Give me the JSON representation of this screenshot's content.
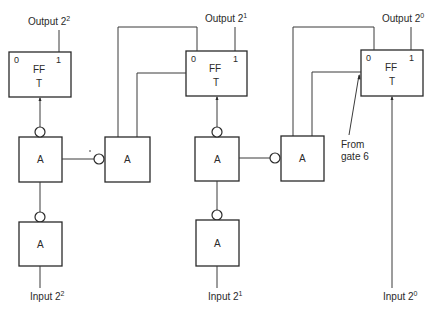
{
  "diagram": {
    "type": "logic-circuit",
    "flipflops": [
      {
        "id": "ff-2-2",
        "title": "FF",
        "subtitle": "T",
        "pin_left": "0",
        "pin_right": "1",
        "output_label": "Output 2",
        "output_exp": "2"
      },
      {
        "id": "ff-2-1",
        "title": "FF",
        "subtitle": "T",
        "pin_left": "0",
        "pin_right": "1",
        "output_label": "Output 2",
        "output_exp": "1"
      },
      {
        "id": "ff-2-0",
        "title": "FF",
        "subtitle": "T",
        "pin_left": "0",
        "pin_right": "1",
        "output_label": "Output 2",
        "output_exp": "0"
      }
    ],
    "gates": [
      {
        "id": "gate-upper-left",
        "label": "A"
      },
      {
        "id": "gate-lower-left",
        "label": "A"
      },
      {
        "id": "gate-upper-second",
        "label": "A"
      },
      {
        "id": "gate-upper-third",
        "label": "A"
      },
      {
        "id": "gate-lower-third",
        "label": "A"
      },
      {
        "id": "gate-upper-fourth",
        "label": "A"
      }
    ],
    "inputs": [
      {
        "label": "Input 2",
        "exp": "2"
      },
      {
        "label": "Input 2",
        "exp": "1"
      },
      {
        "label": "Input 2",
        "exp": "0"
      }
    ],
    "annotation": {
      "line1": "From",
      "line2": "gate 6"
    }
  }
}
